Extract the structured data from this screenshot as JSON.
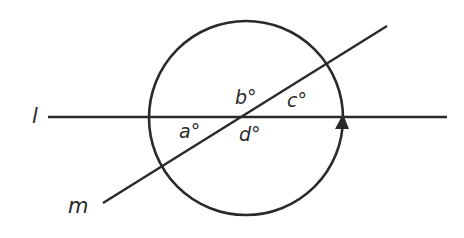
{
  "diagram": {
    "colors": {
      "stroke": "#2a2a2a",
      "background": "#ffffff"
    },
    "circle": {
      "cx": 246,
      "cy": 118,
      "r": 97,
      "arrow_direction": "counterclockwise (arrow pointing up at right side)"
    },
    "lines": [
      {
        "name": "l",
        "label": "l",
        "x1": 48,
        "y1": 117,
        "x2": 447,
        "y2": 117
      },
      {
        "name": "m",
        "label": "m",
        "x1": 103,
        "y1": 203,
        "x2": 387,
        "y2": 26
      }
    ],
    "angles": [
      {
        "name": "a",
        "label": "a°"
      },
      {
        "name": "b",
        "label": "b°"
      },
      {
        "name": "c",
        "label": "c°"
      },
      {
        "name": "d",
        "label": "d°"
      }
    ]
  }
}
